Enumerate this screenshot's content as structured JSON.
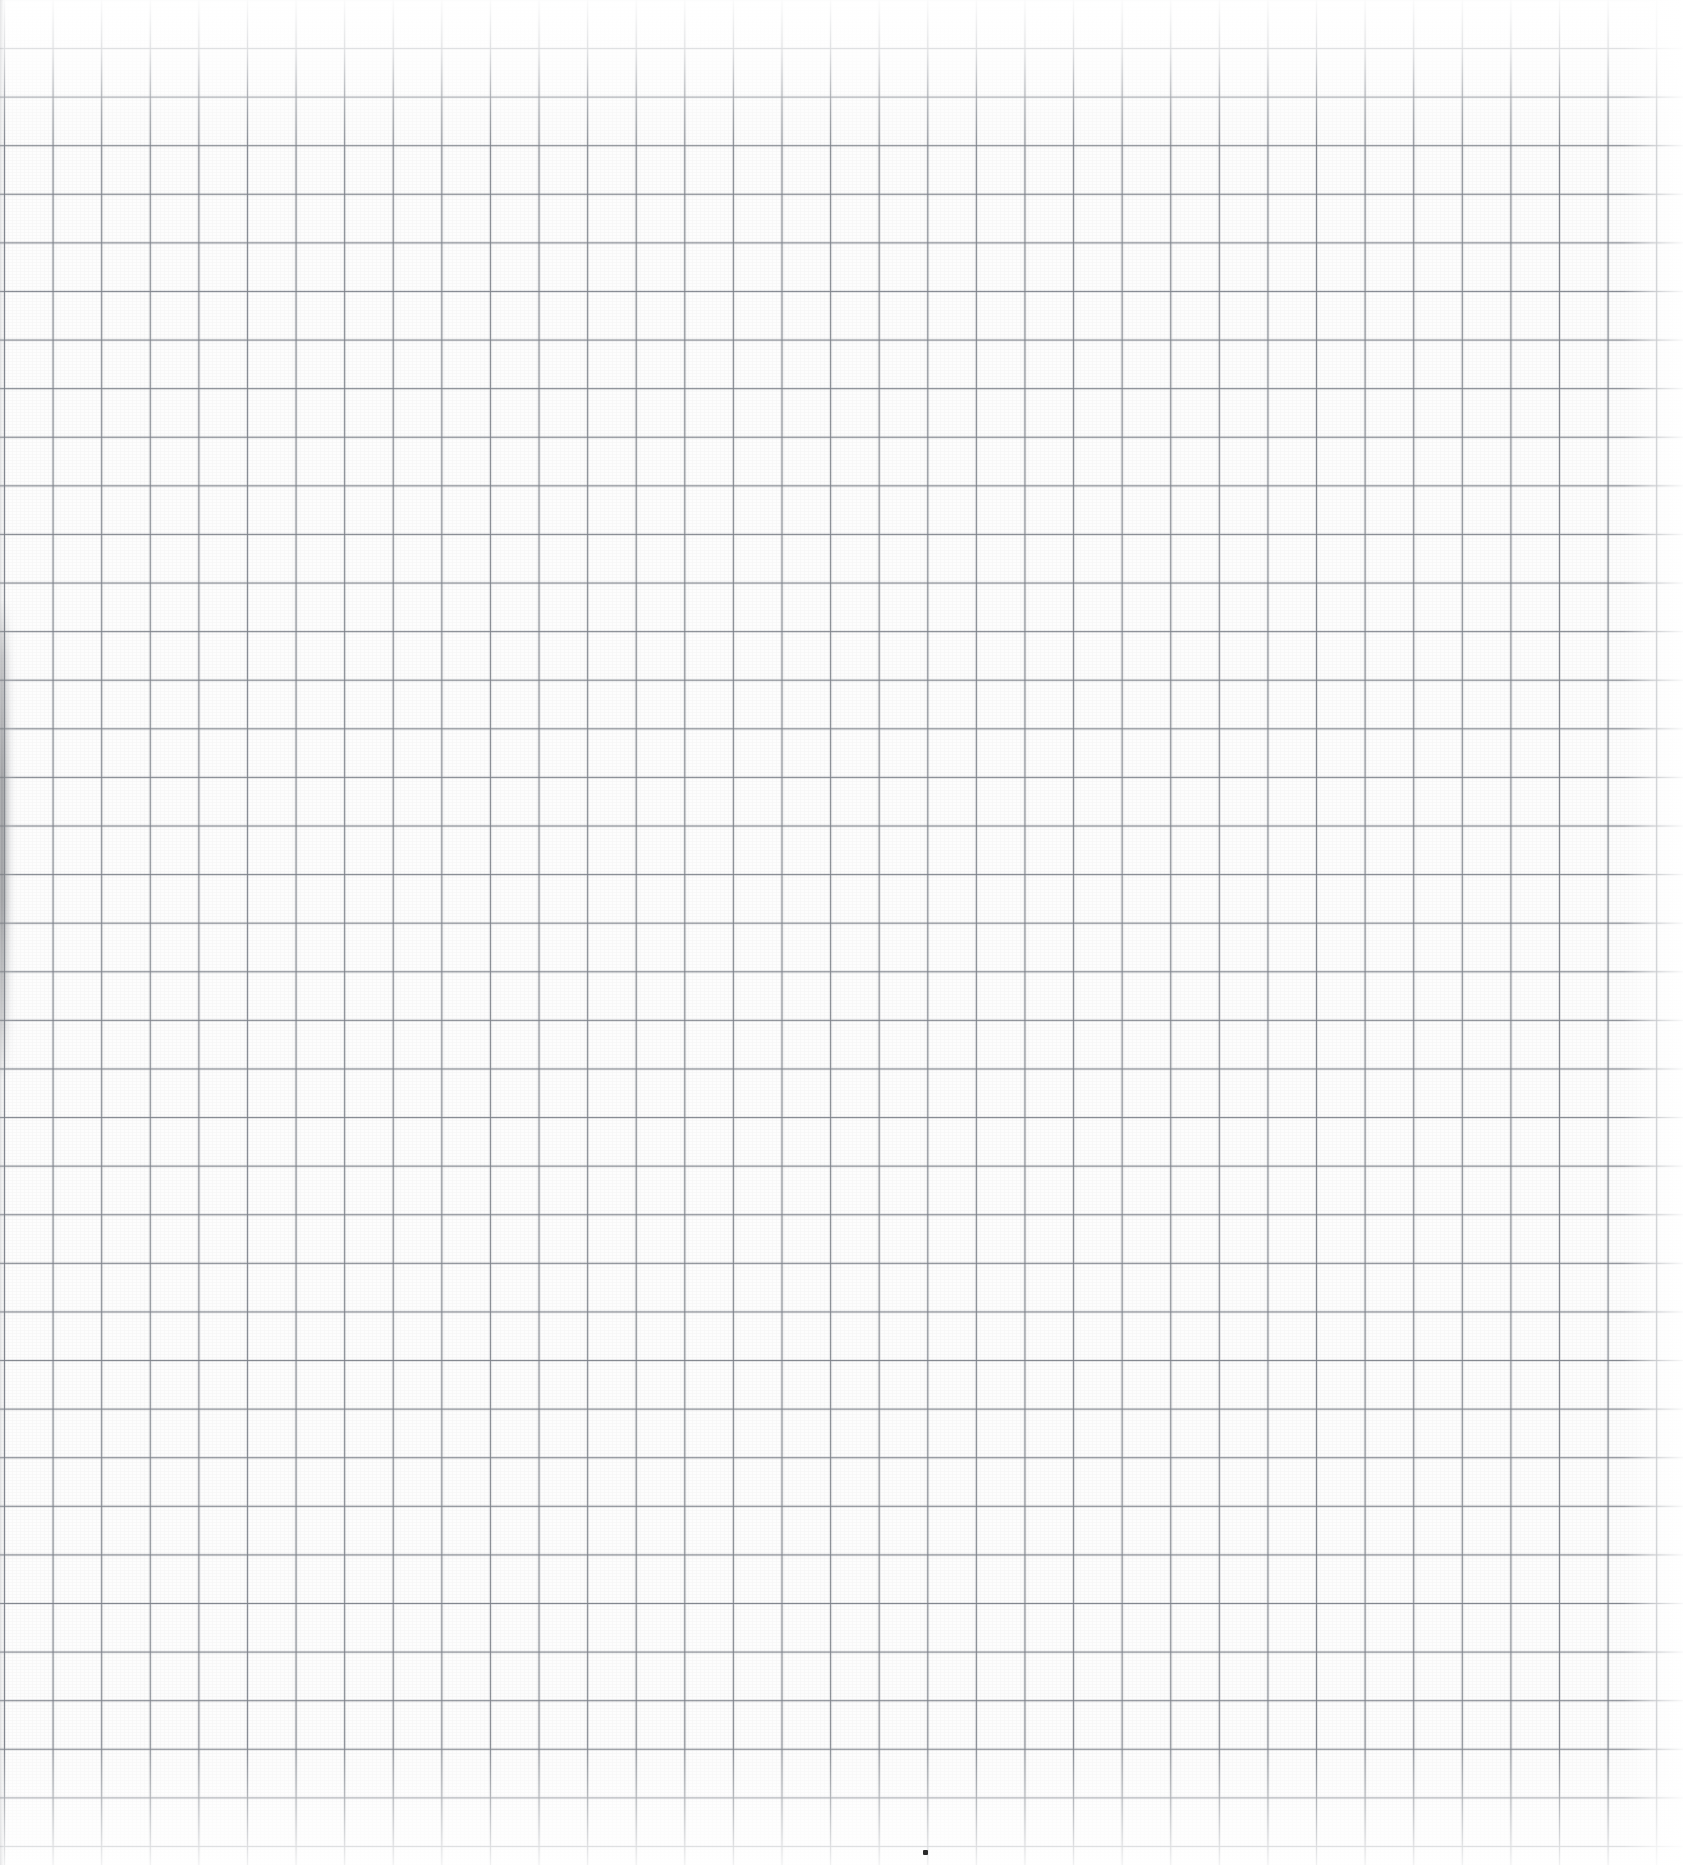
{
  "page": {
    "title": "Blank grid paper sheet",
    "description": "Scanned sheet of blank square-ruled graph paper with no writing",
    "width_px": 1683,
    "height_px": 1865
  },
  "paper": {
    "background_color": "#fdfdfd",
    "grain_opacity": 0.035
  },
  "grid": {
    "type": "square-ruled",
    "line_color": "#7d828a",
    "line_color_soft": "#969ba3",
    "cell_size_px": 48.6,
    "line_width_px": 1.4,
    "origin_offset_x_px": 4,
    "origin_offset_y_px": 48,
    "columns": 34,
    "rows": 38,
    "grid_right_edge_px": 1655,
    "grid_bottom_edge_px": 1865
  },
  "lighting": {
    "top_highlight_height_px": 150,
    "bottom_wash_height_px": 120,
    "right_fade_width_px": 60,
    "highlight_color": "#ffffff"
  },
  "spine_shadow": {
    "label": "left binding shadow",
    "color": "#787a7e",
    "left_px": 0,
    "top_px": 600,
    "width_px": 16,
    "height_px": 480
  },
  "marks": [
    {
      "name": "ink-dot",
      "kind": "dot",
      "color": "#2b2b2b",
      "x_px": 923,
      "y_px": 1850,
      "size_px": 5
    }
  ]
}
